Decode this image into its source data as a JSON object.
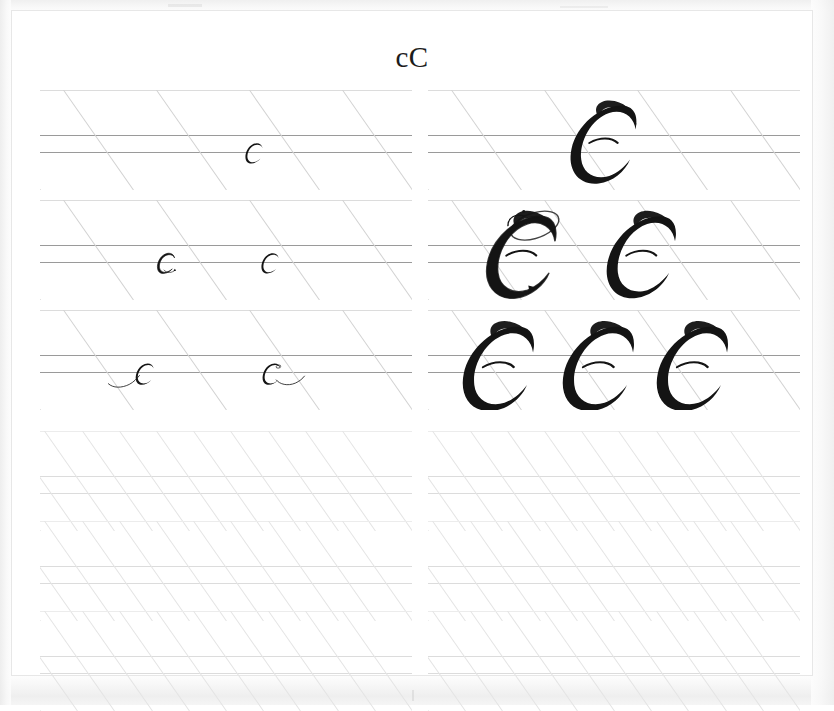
{
  "document": {
    "kind": "calligraphy-practice-worksheet",
    "title": "cC",
    "script_style": "copperplate",
    "page_background": "#ffffff",
    "scan_background": "#fdfdfd",
    "ink_color": "#141414",
    "rule_color_strong": "#9a9a9a",
    "rule_color_faint": "#dcdcdc",
    "slant_color": "#d2d2d2"
  },
  "guidelines": {
    "slant_degrees": 55,
    "lines_per_band": 4,
    "line_roles": [
      "ascender",
      "waistline",
      "baseline",
      "descender"
    ],
    "demo_band_slant_count": 4,
    "practice_band_slant_count": 10
  },
  "columns": [
    {
      "name": "lowercase-column",
      "letter": "c",
      "letter_case": "lowercase",
      "x": 28,
      "width": 372
    },
    {
      "name": "uppercase-column",
      "letter": "C",
      "letter_case": "uppercase",
      "x": 416,
      "width": 372
    }
  ],
  "bands": [
    {
      "id": "band-1-left",
      "column": "lowercase-column",
      "row": 1,
      "kind": "demo",
      "label": "row-1-lowercase-demo",
      "glyph_count": 1,
      "filled": true
    },
    {
      "id": "band-1-right",
      "column": "uppercase-column",
      "row": 1,
      "kind": "demo",
      "label": "row-1-uppercase-demo",
      "glyph_count": 1,
      "filled": true
    },
    {
      "id": "band-2-left",
      "column": "lowercase-column",
      "row": 2,
      "kind": "demo",
      "label": "row-2-lowercase-demo",
      "glyph_count": 2,
      "filled": true
    },
    {
      "id": "band-2-right",
      "column": "uppercase-column",
      "row": 2,
      "kind": "demo",
      "label": "row-2-uppercase-demo",
      "glyph_count": 2,
      "filled": true
    },
    {
      "id": "band-3-left",
      "column": "lowercase-column",
      "row": 3,
      "kind": "demo",
      "label": "row-3-lowercase-demo",
      "glyph_count": 2,
      "filled": true
    },
    {
      "id": "band-3-right",
      "column": "uppercase-column",
      "row": 3,
      "kind": "demo",
      "label": "row-3-uppercase-demo",
      "glyph_count": 3,
      "filled": true
    },
    {
      "id": "band-4-left",
      "column": "lowercase-column",
      "row": 4,
      "kind": "practice",
      "label": "practice-band-left-1",
      "glyph_count": 0,
      "filled": false
    },
    {
      "id": "band-4-right",
      "column": "uppercase-column",
      "row": 4,
      "kind": "practice",
      "label": "practice-band-right-1",
      "glyph_count": 0,
      "filled": false
    },
    {
      "id": "band-5-left",
      "column": "lowercase-column",
      "row": 5,
      "kind": "practice",
      "label": "practice-band-left-2",
      "glyph_count": 0,
      "filled": false
    },
    {
      "id": "band-5-right",
      "column": "uppercase-column",
      "row": 5,
      "kind": "practice",
      "label": "practice-band-right-2",
      "glyph_count": 0,
      "filled": false
    },
    {
      "id": "band-6-left",
      "column": "lowercase-column",
      "row": 6,
      "kind": "practice",
      "label": "practice-band-left-3",
      "glyph_count": 0,
      "filled": false
    },
    {
      "id": "band-6-right",
      "column": "uppercase-column",
      "row": 6,
      "kind": "practice",
      "label": "practice-band-right-3",
      "glyph_count": 0,
      "filled": false
    }
  ],
  "specimens": [
    {
      "band": "band-1-left",
      "letter": "c",
      "variant": "plain",
      "x": 196,
      "scale": 1.0
    },
    {
      "band": "band-1-right",
      "letter": "C",
      "variant": "plain",
      "x": 140,
      "scale": 1.0
    },
    {
      "band": "band-2-left",
      "letter": "c",
      "variant": "traced",
      "x": 108,
      "scale": 1.0
    },
    {
      "band": "band-2-left",
      "letter": "c",
      "variant": "plain",
      "x": 212,
      "scale": 1.0
    },
    {
      "band": "band-2-right",
      "letter": "C",
      "variant": "traced",
      "x": 56,
      "scale": 1.05
    },
    {
      "band": "band-2-right",
      "letter": "C",
      "variant": "plain",
      "x": 176,
      "scale": 1.05
    },
    {
      "band": "band-3-left",
      "letter": "c",
      "variant": "entry-flourish",
      "x": 62,
      "scale": 1.05
    },
    {
      "band": "band-3-left",
      "letter": "c",
      "variant": "exit-flourish",
      "x": 208,
      "scale": 1.05
    },
    {
      "band": "band-3-right",
      "letter": "C",
      "variant": "plain",
      "x": 32,
      "scale": 1.08
    },
    {
      "band": "band-3-right",
      "letter": "C",
      "variant": "plain",
      "x": 132,
      "scale": 1.08
    },
    {
      "band": "band-3-right",
      "letter": "C",
      "variant": "plain",
      "x": 226,
      "scale": 1.08
    }
  ]
}
